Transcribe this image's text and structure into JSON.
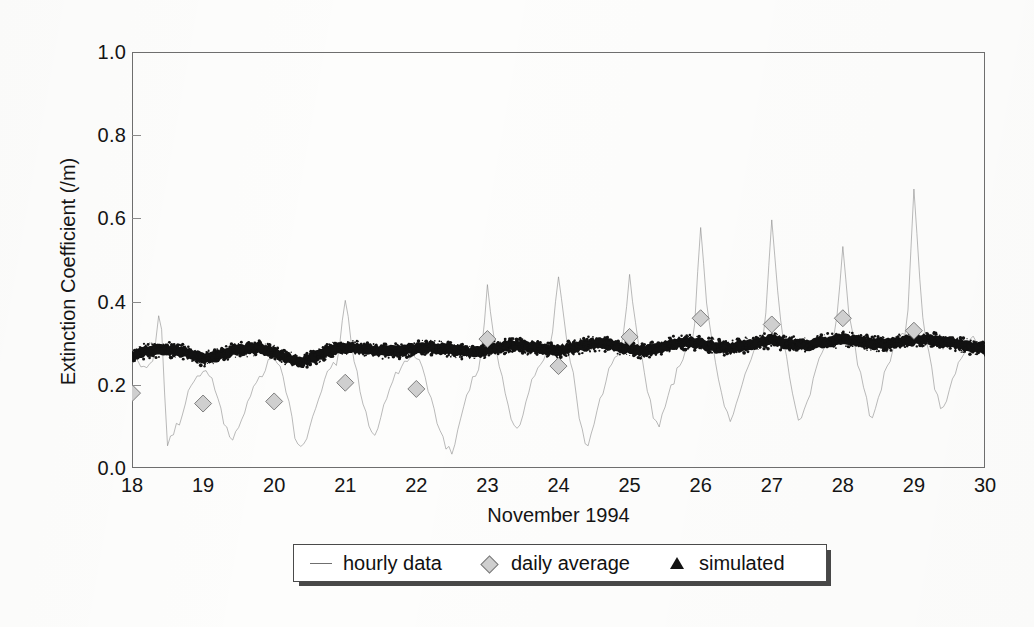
{
  "figure": {
    "background_color": "#fdfdfc",
    "frame_color": "#6e6e6e"
  },
  "chart_data": {
    "type": "line",
    "title": "",
    "subtitle": "",
    "xlabel": "November 1994",
    "ylabel": "Extinction Coefficient (/m)",
    "xlim": [
      18,
      30
    ],
    "ylim": [
      0.0,
      1.0
    ],
    "xticks": [
      18,
      19,
      20,
      21,
      22,
      23,
      24,
      25,
      26,
      27,
      28,
      29,
      30
    ],
    "xtick_labels": [
      "18",
      "19",
      "20",
      "21",
      "22",
      "23",
      "24",
      "25",
      "26",
      "27",
      "28",
      "29",
      "30"
    ],
    "yticks": [
      0.0,
      0.2,
      0.4,
      0.6,
      0.8,
      1.0
    ],
    "ytick_labels": [
      "0.0",
      "0.2",
      "0.4",
      "0.6",
      "0.8",
      "1.0"
    ],
    "grid": false,
    "legend_position": "below-axes",
    "series": [
      {
        "name": "hourly data",
        "marker": "line",
        "color": "#8a8a8a",
        "style": "thin-noisy-line",
        "description": "Hourly extinction coefficient trace; baseline near 0.25 with sharp downward excursions toward 0.0-0.1 each night and tall upward spikes to 0.35-0.68.",
        "x": [
          18.0,
          18.1,
          18.2,
          18.3,
          18.4,
          18.45,
          18.5,
          18.6,
          18.7,
          18.8,
          18.9,
          19.0,
          19.1,
          19.2,
          19.3,
          19.4,
          19.5,
          19.6,
          19.7,
          19.8,
          19.9,
          20.0,
          20.1,
          20.2,
          20.3,
          20.4,
          20.5,
          20.6,
          20.7,
          20.8,
          20.9,
          21.0,
          21.1,
          21.2,
          21.3,
          21.4,
          21.5,
          21.6,
          21.7,
          21.8,
          21.9,
          22.0,
          22.1,
          22.2,
          22.3,
          22.4,
          22.5,
          22.6,
          22.7,
          22.8,
          22.9,
          23.0,
          23.1,
          23.2,
          23.3,
          23.4,
          23.5,
          23.6,
          23.7,
          23.8,
          23.9,
          24.0,
          24.1,
          24.2,
          24.3,
          24.4,
          24.5,
          24.6,
          24.7,
          24.8,
          24.9,
          25.0,
          25.1,
          25.2,
          25.3,
          25.4,
          25.5,
          25.6,
          25.7,
          25.8,
          25.9,
          26.0,
          26.1,
          26.2,
          26.3,
          26.4,
          26.5,
          26.6,
          26.7,
          26.8,
          26.9,
          27.0,
          27.1,
          27.2,
          27.3,
          27.4,
          27.5,
          27.6,
          27.7,
          27.8,
          27.9,
          28.0,
          28.1,
          28.2,
          28.3,
          28.4,
          28.5,
          28.6,
          28.7,
          28.8,
          28.9,
          29.0,
          29.1,
          29.2,
          29.3,
          29.4,
          29.5,
          29.6,
          29.7,
          29.8,
          29.9,
          30.0
        ],
        "y": [
          0.26,
          0.25,
          0.24,
          0.25,
          0.41,
          0.2,
          0.06,
          0.09,
          0.12,
          0.18,
          0.22,
          0.24,
          0.22,
          0.18,
          0.11,
          0.06,
          0.09,
          0.14,
          0.19,
          0.22,
          0.25,
          0.26,
          0.23,
          0.16,
          0.07,
          0.05,
          0.1,
          0.16,
          0.21,
          0.24,
          0.26,
          0.41,
          0.28,
          0.2,
          0.12,
          0.08,
          0.12,
          0.18,
          0.22,
          0.25,
          0.27,
          0.27,
          0.24,
          0.17,
          0.1,
          0.06,
          0.03,
          0.11,
          0.17,
          0.22,
          0.25,
          0.44,
          0.3,
          0.22,
          0.14,
          0.08,
          0.13,
          0.19,
          0.24,
          0.27,
          0.29,
          0.47,
          0.32,
          0.23,
          0.12,
          0.05,
          0.1,
          0.17,
          0.23,
          0.27,
          0.3,
          0.46,
          0.33,
          0.24,
          0.15,
          0.09,
          0.14,
          0.2,
          0.25,
          0.29,
          0.31,
          0.57,
          0.36,
          0.26,
          0.17,
          0.11,
          0.15,
          0.21,
          0.26,
          0.3,
          0.32,
          0.6,
          0.38,
          0.27,
          0.16,
          0.1,
          0.16,
          0.22,
          0.27,
          0.31,
          0.33,
          0.53,
          0.35,
          0.26,
          0.18,
          0.12,
          0.17,
          0.23,
          0.28,
          0.31,
          0.33,
          0.67,
          0.4,
          0.28,
          0.19,
          0.13,
          0.18,
          0.24,
          0.28,
          0.31,
          0.3,
          0.29
        ]
      },
      {
        "name": "daily average",
        "marker": "diamond",
        "color": "#cfcfcf",
        "edge_color": "#7d7d7d",
        "x": [
          18,
          19,
          20,
          21,
          22,
          23,
          24,
          25,
          26,
          27,
          28,
          29
        ],
        "y": [
          0.18,
          0.155,
          0.16,
          0.205,
          0.19,
          0.31,
          0.245,
          0.315,
          0.36,
          0.345,
          0.36,
          0.33
        ]
      },
      {
        "name": "simulated",
        "marker": "triangle",
        "color": "#121212",
        "style": "dense-thick-band",
        "description": "Dense black band of simulated hourly values forming a thick ribbon between roughly 0.25 and 0.32, rising gently from day 18 to day 29.",
        "x": [
          18.0,
          18.2,
          18.4,
          18.6,
          18.8,
          19.0,
          19.2,
          19.4,
          19.6,
          19.8,
          20.0,
          20.2,
          20.4,
          20.6,
          20.8,
          21.0,
          21.2,
          21.4,
          21.6,
          21.8,
          22.0,
          22.2,
          22.4,
          22.6,
          22.8,
          23.0,
          23.2,
          23.4,
          23.6,
          23.8,
          24.0,
          24.2,
          24.4,
          24.6,
          24.8,
          25.0,
          25.2,
          25.4,
          25.6,
          25.8,
          26.0,
          26.2,
          26.4,
          26.6,
          26.8,
          27.0,
          27.2,
          27.4,
          27.6,
          27.8,
          28.0,
          28.2,
          28.4,
          28.6,
          28.8,
          29.0,
          29.2,
          29.4,
          29.6,
          29.8,
          30.0
        ],
        "y": [
          0.268,
          0.282,
          0.285,
          0.283,
          0.276,
          0.262,
          0.27,
          0.281,
          0.286,
          0.288,
          0.279,
          0.262,
          0.256,
          0.268,
          0.284,
          0.289,
          0.288,
          0.283,
          0.279,
          0.282,
          0.287,
          0.29,
          0.286,
          0.281,
          0.277,
          0.283,
          0.292,
          0.296,
          0.29,
          0.284,
          0.281,
          0.289,
          0.297,
          0.299,
          0.293,
          0.286,
          0.281,
          0.288,
          0.298,
          0.303,
          0.299,
          0.292,
          0.288,
          0.294,
          0.303,
          0.306,
          0.301,
          0.295,
          0.298,
          0.305,
          0.309,
          0.306,
          0.3,
          0.297,
          0.303,
          0.308,
          0.311,
          0.305,
          0.298,
          0.291,
          0.286
        ],
        "band_half_width": 0.013
      }
    ]
  },
  "legend": {
    "entries": [
      {
        "label": "hourly data",
        "marker": "line"
      },
      {
        "label": "daily average",
        "marker": "diamond"
      },
      {
        "label": "simulated",
        "marker": "triangle"
      }
    ]
  }
}
